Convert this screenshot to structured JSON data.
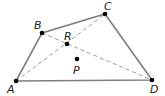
{
  "diagram": {
    "type": "quadrilateral with diagonals",
    "points": [
      {
        "id": "A",
        "label": "A",
        "x": 16,
        "y": 81,
        "lx": 7,
        "ly": 93
      },
      {
        "id": "B",
        "label": "B",
        "x": 42,
        "y": 33,
        "lx": 34,
        "ly": 29
      },
      {
        "id": "C",
        "label": "C",
        "x": 105,
        "y": 14,
        "lx": 104,
        "ly": 10
      },
      {
        "id": "D",
        "label": "D",
        "x": 152,
        "y": 80,
        "lx": 150,
        "ly": 93
      },
      {
        "id": "R",
        "label": "R",
        "x": 67,
        "y": 44,
        "lx": 64,
        "ly": 40
      },
      {
        "id": "P",
        "label": "P",
        "x": 77,
        "y": 59,
        "lx": 73,
        "ly": 74
      }
    ],
    "sides": [
      "AB",
      "BC",
      "CD",
      "DA"
    ],
    "diagonals_dashed": [
      "AC",
      "BD"
    ],
    "colors": {
      "line": "#808080",
      "point": "#000000",
      "label": "#222222"
    }
  }
}
